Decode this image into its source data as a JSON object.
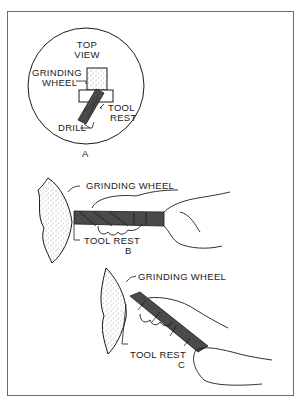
{
  "figure": {
    "panel_a": {
      "title_line1": "TOP",
      "title_line2": "VIEW",
      "grinding_wheel_line1": "GRINDING",
      "grinding_wheel_line2": "WHEEL",
      "tool_rest_line1": "TOOL",
      "tool_rest_line2": "REST",
      "drill": "DRILL",
      "caption": "A"
    },
    "panel_b": {
      "grinding_wheel": "GRINDING  WHEEL",
      "tool_rest": "TOOL  REST",
      "caption": "B"
    },
    "panel_c": {
      "grinding_wheel": "GRINDING  WHEEL",
      "tool_rest": "TOOL REST",
      "caption": "C"
    }
  },
  "colors": {
    "line": "#1a1a1a",
    "drill_fill": "#4a4a4a",
    "frame": "#6a6a6a",
    "background": "#ffffff"
  }
}
